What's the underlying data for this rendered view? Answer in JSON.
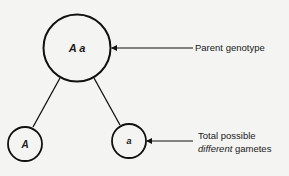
{
  "diagram": {
    "parent": {
      "label": "A a"
    },
    "gametes": [
      {
        "label": "A"
      },
      {
        "label": "a"
      }
    ],
    "annotations": {
      "parent_genotype": "Parent genotype",
      "gametes_line1": "Total possible",
      "gametes_line2_italic": "different",
      "gametes_line2_rest": " gametes"
    },
    "colors": {
      "stroke": "#111111",
      "background": "#f4f4f2"
    }
  }
}
